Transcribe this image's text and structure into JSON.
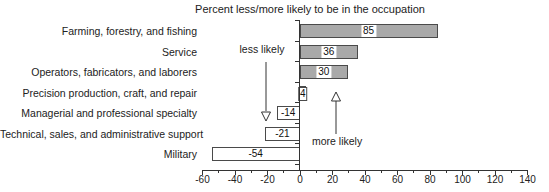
{
  "title": "Percent less/more likely to be in the occupation",
  "chart_data": {
    "type": "bar",
    "orientation": "horizontal",
    "title": "Percent less/more likely to be in the occupation",
    "categories": [
      "Farming, forestry, and fishing",
      "Service",
      "Operators, fabricators, and laborers",
      "Precision production, craft, and repair",
      "Managerial and professional specialty",
      "Technical, sales, and administrative support",
      "Military"
    ],
    "values": [
      85,
      36,
      30,
      4,
      -14,
      -21,
      -54
    ],
    "bar_labels": [
      "85",
      "36",
      "30",
      "4",
      "-14",
      "-21",
      "-54"
    ],
    "xlabel": "",
    "ylabel": "",
    "xlim": [
      -60,
      140
    ],
    "x_ticks": [
      -60,
      -40,
      -20,
      0,
      20,
      40,
      60,
      80,
      100,
      120,
      140
    ],
    "grid": false,
    "legend": "none",
    "bar_colors": {
      "positive": "#a9a9a9",
      "negative": "#ffffff"
    },
    "bar_border_color": "#4a4a4a",
    "annotations": [
      {
        "text": "less likely",
        "arrow": "down",
        "x": -20
      },
      {
        "text": "more likely",
        "arrow": "up",
        "x": 22
      }
    ]
  }
}
